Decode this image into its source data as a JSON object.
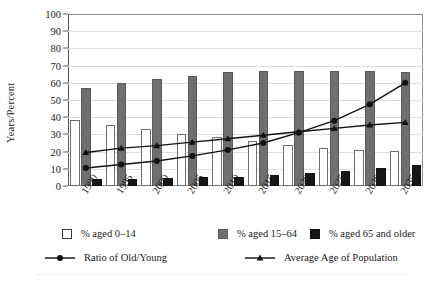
{
  "chart_data": {
    "type": "bar",
    "title": "",
    "xlabel": "",
    "ylabel": "Years/Percent",
    "ylim": [
      0,
      100
    ],
    "ytick_step": 10,
    "yticks": [
      0,
      10,
      20,
      30,
      40,
      50,
      60,
      70,
      80,
      90,
      100
    ],
    "grid": true,
    "legend_position": "bottom",
    "categories": [
      "1990",
      "1995",
      "2000",
      "2005",
      "2010",
      "2015",
      "2020",
      "2025",
      "2030",
      "2035"
    ],
    "series": [
      {
        "name": "% aged 0–14",
        "kind": "bar",
        "color": "#ffffff",
        "edge_color": "#6e6e6e",
        "values": [
          38.5,
          35.5,
          33,
          30.5,
          28.5,
          26,
          24,
          22,
          21,
          20.5
        ]
      },
      {
        "name": "% aged 15–64",
        "kind": "bar",
        "color": "#6f6f6f",
        "edge_color": "#5a5a5a",
        "values": [
          57,
          60,
          62,
          64,
          66,
          67,
          67,
          67,
          67,
          66
        ]
      },
      {
        "name": "% aged 65 and older",
        "kind": "bar",
        "color": "#161616",
        "edge_color": "#111111",
        "values": [
          4,
          4.2,
          4.5,
          5,
          5.5,
          6.5,
          7.5,
          9,
          10.5,
          12
        ]
      },
      {
        "name": "Ratio of Old/Young",
        "kind": "line",
        "marker": "circle",
        "color": "#111111",
        "values": [
          10.5,
          12.5,
          14.5,
          17.5,
          21,
          25,
          31,
          38,
          47.5,
          60
        ]
      },
      {
        "name": "Average Age of Population",
        "kind": "line",
        "marker": "triangle",
        "color": "#111111",
        "values": [
          19.5,
          22,
          23.5,
          25.5,
          27.5,
          29.5,
          31.5,
          33.5,
          35.5,
          37
        ]
      }
    ]
  },
  "axis": {
    "ylabel": "Years/Percent"
  },
  "legend": {
    "row1": [
      {
        "label": "% aged 0–14",
        "swatch": "young",
        "name": "legend-swatch-aged-0-14"
      },
      {
        "label": "% aged 15–64",
        "swatch": "work",
        "name": "legend-swatch-aged-15-64"
      },
      {
        "label": "% aged 65 and older",
        "swatch": "old",
        "name": "legend-swatch-aged-65-older"
      }
    ],
    "row2": [
      {
        "label": "Ratio of Old/Young",
        "marker": "circle",
        "name": "legend-line-ratio-old-young"
      },
      {
        "label": "Average Age of Population",
        "marker": "triangle",
        "name": "legend-line-average-age"
      }
    ]
  }
}
